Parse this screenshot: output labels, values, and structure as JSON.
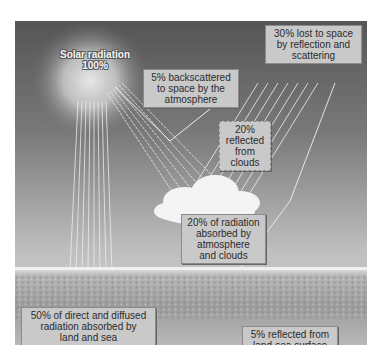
{
  "figure": {
    "sun": {
      "label_line1": "Solar radiation",
      "label_line2": "100%"
    },
    "labels": {
      "backscattered": {
        "line1": "5% backscattered",
        "line2": "to space by the",
        "line3": "atmosphere"
      },
      "lost_to_space": {
        "line1": "30% lost to space",
        "line2": "by reflection and",
        "line3": "scattering"
      },
      "reflected_clouds": {
        "line1": "20%",
        "line2": "reflected",
        "line3": "from",
        "line4": "clouds"
      },
      "absorbed_atmosphere": {
        "line1": "20% of radiation",
        "line2": "absorbed by",
        "line3": "atmosphere",
        "line4": "and clouds"
      },
      "absorbed_land_sea": {
        "line1": "50% of direct and diffused",
        "line2": "radiation absorbed by",
        "line3": "land and sea"
      },
      "reflected_surface": {
        "line1": "5% reflected from",
        "line2": "land-sea surface"
      }
    },
    "colors": {
      "sky_top": "#5a5a5a",
      "sky_bottom": "#d6d6d6",
      "ground": "#a9a9a9",
      "label_bg": "#c9c9c9",
      "ray": "#f2f2f2"
    }
  }
}
